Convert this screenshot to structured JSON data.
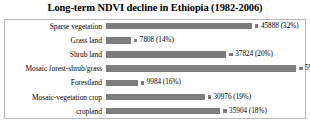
{
  "chart_data": {
    "type": "bar",
    "orientation": "horizontal",
    "title": "Long-term NDVI decline in Ethiopia (1982-2006)",
    "xlabel": "",
    "ylabel": "",
    "grid": false,
    "legend": "none",
    "bar_color": "#7d7d7d",
    "border_color": "#b9b9b9",
    "axis_max": 59776,
    "categories": [
      "Sparse vegetation",
      "Grass land",
      "Shrub land",
      "Mosaic forest-shrub/grass",
      "Forestland",
      "Mosaic-vegetation crop",
      "cropland"
    ],
    "values": [
      45888,
      7808,
      37824,
      59776,
      9984,
      30976,
      35904
    ],
    "percents": [
      "32%",
      "14%",
      "20%",
      "27%",
      "16%",
      "19%",
      "18%"
    ],
    "data_labels": [
      "45888 (32%)",
      "7808 (14%)",
      "37824 (20%)",
      "59776 (27%)",
      "9984 (16%)",
      "30976 (19%)",
      "35904 (18%)"
    ]
  }
}
